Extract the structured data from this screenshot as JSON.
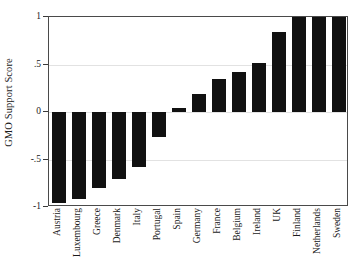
{
  "chart_data": {
    "type": "bar",
    "title": "",
    "subtitle": "",
    "xlabel": "",
    "ylabel": "GMO Support Score",
    "ylim": [
      -1,
      1
    ],
    "yticks": [
      1,
      0.5,
      0,
      -0.5,
      -1
    ],
    "ytick_labels": [
      "1",
      ".5",
      "0",
      "-.5",
      "-1"
    ],
    "grid": true,
    "grid_axis": "y",
    "legend": null,
    "orientation": "vertical",
    "bar_color": "#111111",
    "categories": [
      "Austria",
      "Luxembourg",
      "Greece",
      "Denmark",
      "Italy",
      "Portugal",
      "Spain",
      "Germany",
      "France",
      "Belgium",
      "Ireland",
      "UK",
      "Finland",
      "Netherlands",
      "Sweden"
    ],
    "values": [
      -0.96,
      -0.92,
      -0.8,
      -0.7,
      -0.58,
      -0.26,
      0.04,
      0.19,
      0.35,
      0.42,
      0.52,
      0.84,
      1.0,
      1.0,
      1.0
    ]
  },
  "axes": {
    "y_title": "GMO Support Score"
  }
}
